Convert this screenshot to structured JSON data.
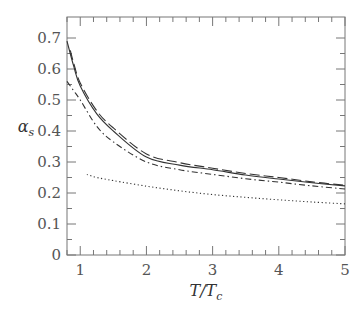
{
  "chart_data": {
    "type": "line",
    "title": "",
    "xlabel": "T/T_c",
    "ylabel": "α_s",
    "xlim": [
      0.8,
      5
    ],
    "ylim": [
      0,
      0.75
    ],
    "grid": false,
    "legend": null,
    "xticks": [
      1,
      2,
      3,
      4,
      5
    ],
    "yticks": [
      0,
      0.1,
      0.2,
      0.3,
      0.4,
      0.5,
      0.6,
      0.7
    ],
    "series": [
      {
        "name": "solid",
        "style": "solid",
        "x": [
          0.8,
          0.9,
          1.0,
          1.25,
          1.5,
          2.0,
          2.5,
          3.0,
          3.5,
          4.0,
          4.5,
          5.0
        ],
        "y": [
          0.69,
          0.61,
          0.545,
          0.455,
          0.4,
          0.316,
          0.29,
          0.275,
          0.258,
          0.245,
          0.233,
          0.223
        ]
      },
      {
        "name": "dashed",
        "style": "dashed",
        "x": [
          0.85,
          0.9,
          1.0,
          1.25,
          1.5,
          2.0,
          2.5,
          3.0,
          3.5,
          4.0,
          4.5,
          5.0
        ],
        "y": [
          0.66,
          0.62,
          0.555,
          0.465,
          0.41,
          0.326,
          0.298,
          0.28,
          0.263,
          0.25,
          0.236,
          0.225
        ]
      },
      {
        "name": "dash-dot",
        "style": "dashdot",
        "x": [
          0.8,
          0.9,
          1.0,
          1.25,
          1.5,
          2.0,
          2.5,
          3.0,
          3.5,
          4.0,
          4.5,
          5.0
        ],
        "y": [
          0.56,
          0.53,
          0.5,
          0.415,
          0.365,
          0.3,
          0.275,
          0.26,
          0.246,
          0.235,
          0.223,
          0.213
        ]
      },
      {
        "name": "dotted",
        "style": "dotted",
        "x": [
          1.1,
          1.25,
          1.5,
          2.0,
          2.5,
          3.0,
          3.5,
          4.0,
          4.5,
          5.0
        ],
        "y": [
          0.26,
          0.25,
          0.24,
          0.222,
          0.207,
          0.195,
          0.186,
          0.178,
          0.171,
          0.165
        ]
      }
    ]
  }
}
